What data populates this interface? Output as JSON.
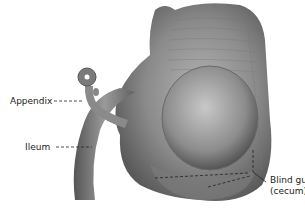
{
  "diagram": {
    "type": "anatomical illustration",
    "labels": {
      "appendix": "Appendix",
      "ileum": "Ileum",
      "cecum_line1": "Blind gut",
      "cecum_line2": "(cecum)"
    }
  }
}
